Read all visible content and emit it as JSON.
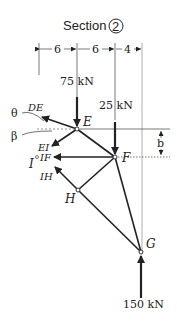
{
  "title": "Section",
  "section_number": "2",
  "dimensions": [
    "6",
    "6",
    "4"
  ],
  "loads": {
    "E": "75 kN",
    "F": "25 kN",
    "G": "150 kN"
  },
  "nodes": [
    "E",
    "F",
    "H",
    "G"
  ],
  "members": {
    "DE": "DE",
    "EI": "EI",
    "IF": "IF",
    "IH": "IH"
  },
  "angles": {
    "theta": "θ",
    "beta": "β"
  },
  "point_label": "I",
  "height_label": "b"
}
